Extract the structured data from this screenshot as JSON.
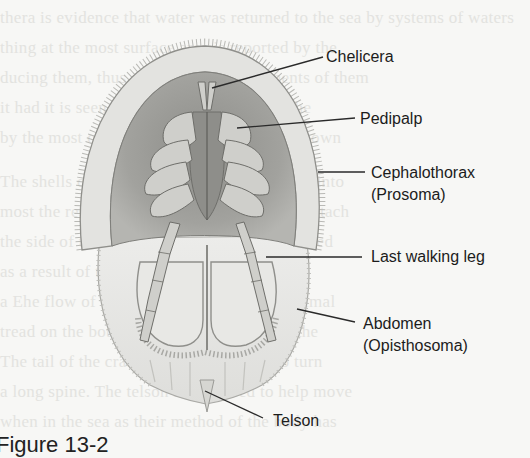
{
  "figure": {
    "caption": "Figure 13-2",
    "labels": [
      {
        "id": "chelicera",
        "text": "Chelicera"
      },
      {
        "id": "pedipalp",
        "text": "Pedipalp"
      },
      {
        "id": "cephalothorax",
        "text": "Cephalothorax",
        "subtext": "(Prosoma)"
      },
      {
        "id": "last-walking-leg",
        "text": "Last walking leg"
      },
      {
        "id": "abdomen",
        "text": "Abdomen",
        "subtext": "(Opisthosoma)"
      },
      {
        "id": "telson",
        "text": "Telson"
      }
    ]
  },
  "colors": {
    "background": "#f7f7f5",
    "label_text": "#1c1c1c",
    "leader_line": "#2a2a2a",
    "carapace_rim": "#d9d9d6",
    "carapace_inner": "#9c9c98",
    "appendages": "#c4c4c0",
    "abdomen": "#e4e4e1"
  }
}
